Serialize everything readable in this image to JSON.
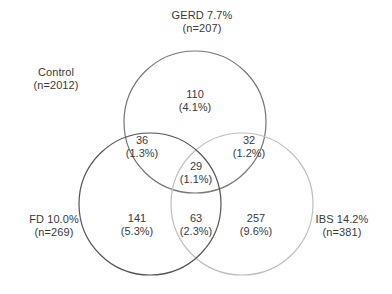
{
  "figure": {
    "type": "venn-diagram",
    "sets": 3,
    "background": "#ffffff",
    "text_color": "#3a3a3a"
  },
  "sets": {
    "control": {
      "name": "Control",
      "line1": "Control",
      "line2": "(n=2012)",
      "n": 2012
    },
    "gerd": {
      "name": "GERD",
      "line1": "GERD 7.7%",
      "line2": "(n=207)",
      "percent": "7.7%",
      "n": 207,
      "stroke": "#777777"
    },
    "fd": {
      "name": "FD",
      "line1": "FD 10.0%",
      "line2": "(n=269)",
      "percent": "10.0%",
      "n": 269,
      "stroke": "#555555"
    },
    "ibs": {
      "name": "IBS",
      "line1": "IBS 14.2%",
      "line2": "(n=381)",
      "percent": "14.2%",
      "n": 381,
      "stroke": "#bfbfbf"
    }
  },
  "regions": {
    "gerd_only": {
      "count": "110",
      "percent": "(4.1%)"
    },
    "gerd_fd": {
      "count": "36",
      "percent": "(1.3%)"
    },
    "gerd_ibs": {
      "count": "32",
      "percent": "(1.2%)"
    },
    "all_three": {
      "count": "29",
      "percent": "(1.1%)"
    },
    "fd_only": {
      "count": "141",
      "percent": "(5.3%)"
    },
    "fd_ibs": {
      "count": "63",
      "percent": "(2.3%)"
    },
    "ibs_only": {
      "count": "257",
      "percent": "(9.6%)"
    }
  },
  "chart_data": {
    "type": "venn",
    "title": "",
    "total_n": 2012,
    "set_labels": [
      "GERD",
      "FD",
      "IBS"
    ],
    "set_totals": [
      207,
      269,
      381
    ],
    "set_percents": [
      "7.7%",
      "10.0%",
      "14.2%"
    ],
    "universe_label": "Control",
    "universe_n": 2012,
    "regions": [
      {
        "sets": [
          "GERD"
        ],
        "count": 110,
        "percent": 4.1
      },
      {
        "sets": [
          "GERD",
          "FD"
        ],
        "count": 36,
        "percent": 1.3
      },
      {
        "sets": [
          "GERD",
          "IBS"
        ],
        "count": 32,
        "percent": 1.2
      },
      {
        "sets": [
          "GERD",
          "FD",
          "IBS"
        ],
        "count": 29,
        "percent": 1.1
      },
      {
        "sets": [
          "FD"
        ],
        "count": 141,
        "percent": 5.3
      },
      {
        "sets": [
          "FD",
          "IBS"
        ],
        "count": 63,
        "percent": 2.3
      },
      {
        "sets": [
          "IBS"
        ],
        "count": 257,
        "percent": 9.6
      }
    ],
    "circles": [
      {
        "set": "GERD",
        "cx": 195,
        "cy": 122,
        "r": 71,
        "stroke": "#777777"
      },
      {
        "set": "FD",
        "cx": 150,
        "cy": 204,
        "r": 71,
        "stroke": "#555555"
      },
      {
        "set": "IBS",
        "cx": 242,
        "cy": 204,
        "r": 71,
        "stroke": "#bfbfbf"
      }
    ],
    "legend": "inline-outer-labels",
    "grid": false
  }
}
